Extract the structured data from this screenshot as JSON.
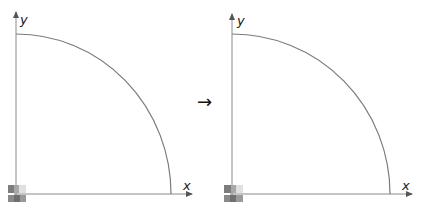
{
  "diagram": {
    "transition_arrow": "→",
    "panels": [
      {
        "id": "left",
        "x_label": "x",
        "y_label": "y",
        "origin": [
          16,
          194
        ],
        "arc_radius_x": 155,
        "arc_radius_y": 160,
        "y_axis_top": 10,
        "x_axis_end": 194
      },
      {
        "id": "right",
        "x_label": "x",
        "y_label": "y",
        "origin": [
          232,
          194
        ],
        "arc_radius_x": 158,
        "arc_radius_y": 160,
        "y_axis_top": 12,
        "x_axis_end": 414
      }
    ],
    "colors": {
      "axis": "#8a8a8a",
      "curve": "#7a7a7a",
      "arrow": "#111111",
      "origin_block_dark": "#7d7d7d",
      "origin_block_mid": "#a8a8a8",
      "origin_block_light": "#e0e0e0"
    }
  }
}
